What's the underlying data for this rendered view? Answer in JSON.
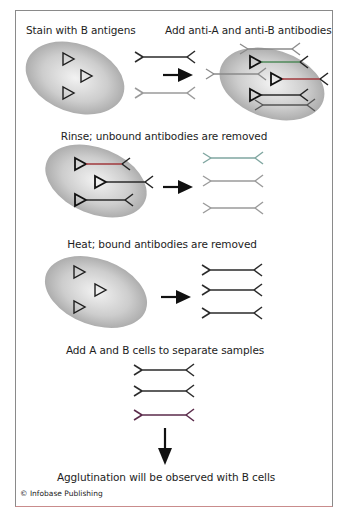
{
  "steps": [
    {
      "label": "Stain with B antigens"
    },
    {
      "label": "Add anti-A and anti-B antibodies"
    },
    {
      "label": "Rinse; unbound antibodies are removed"
    },
    {
      "label": "Heat; bound antibodies are removed"
    },
    {
      "label": "Add A and B cells to separate samples"
    },
    {
      "label": "Agglutination will be observed with B cells"
    }
  ],
  "copyright": "© Infobase Publishing",
  "colors": {
    "cell_center": "#f0f0f0",
    "cell_edge": "#a6a6a6",
    "antibody_dark": "#2a2a2a",
    "antibody_gray": "#9a9a9a",
    "antibody_green": "#4f8a5a",
    "antibody_red": "#a0383c",
    "antibody_teal": "#7fa6a0",
    "frame": "#8a8a8a"
  },
  "icons": {
    "antigen": "triangle-outline",
    "antibody": "y-shaped-double-fork",
    "arrow_right": "filled-arrow-right",
    "arrow_down": "filled-arrow-down"
  }
}
